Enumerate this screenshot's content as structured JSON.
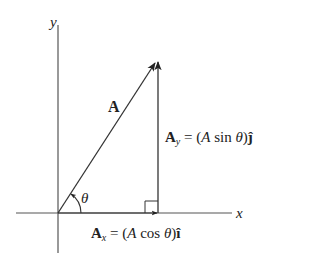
{
  "diagram": {
    "type": "vector-components",
    "axes": {
      "x_label": "x",
      "y_label": "y"
    },
    "vector": {
      "name": "A"
    },
    "angle": {
      "symbol": "θ"
    },
    "components": {
      "x": {
        "name": "A",
        "subscript": "x",
        "equals": " = (",
        "magnitude_symbol": "A",
        "function": " cos ",
        "angle": "θ",
        "close": ")",
        "unit_vector": "î"
      },
      "y": {
        "name": "A",
        "subscript": "y",
        "equals": " = (",
        "magnitude_symbol": "A",
        "function": " sin ",
        "angle": "θ",
        "close": ")",
        "unit_vector": "ĵ"
      }
    },
    "colors": {
      "line": "#333333",
      "background": "#ffffff"
    }
  }
}
